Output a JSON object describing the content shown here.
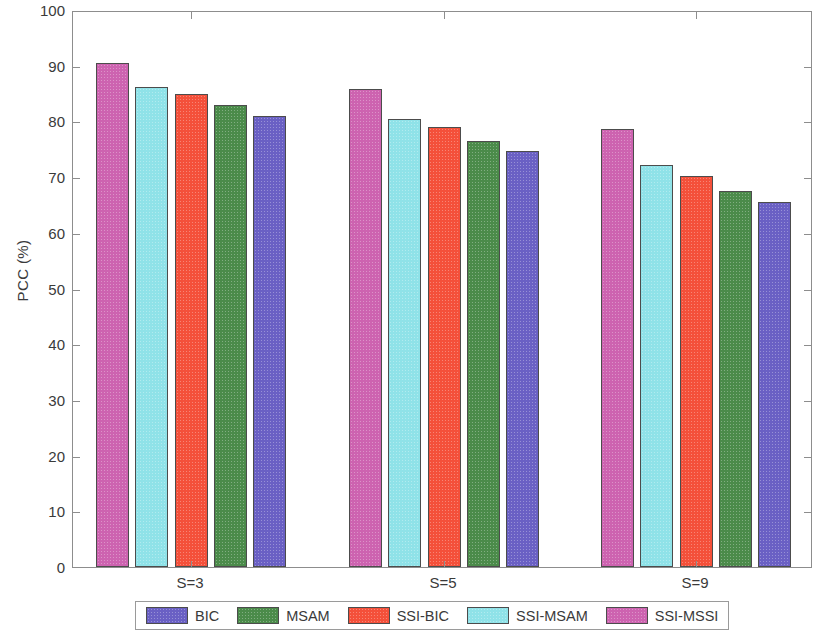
{
  "chart_data": {
    "type": "bar",
    "title": "",
    "subtitle": "",
    "xlabel": "",
    "ylabel": "PCC (%)",
    "categories": [
      "S=3",
      "S=5",
      "S=9"
    ],
    "ylim": [
      0,
      100
    ],
    "yticks": [
      0,
      10,
      20,
      30,
      40,
      50,
      60,
      70,
      80,
      90,
      100
    ],
    "ytick_labels": [
      "0",
      "10",
      "20",
      "30",
      "40",
      "50",
      "60",
      "70",
      "80",
      "90",
      "100"
    ],
    "grid": false,
    "legend_position": "bottom",
    "bar_draw_order": [
      "SSI-MSSI",
      "SSI-MSAM",
      "SSI-BIC",
      "MSAM",
      "BIC"
    ],
    "series": [
      {
        "name": "BIC",
        "color": "#6a60c4",
        "values": [
          81.0,
          74.7,
          65.5
        ]
      },
      {
        "name": "MSAM",
        "color": "#4b8b4a",
        "values": [
          83.0,
          76.4,
          67.5
        ]
      },
      {
        "name": "SSI-BIC",
        "color": "#f4503a",
        "values": [
          85.0,
          79.0,
          70.2
        ]
      },
      {
        "name": "SSI-MSAM",
        "color": "#8fe2e8",
        "values": [
          86.1,
          80.4,
          72.2
        ]
      },
      {
        "name": "SSI-MSSI",
        "color": "#cd63b0",
        "values": [
          90.5,
          85.9,
          78.6
        ]
      }
    ]
  },
  "legend": {
    "items": [
      {
        "label": "BIC",
        "color": "#6a60c4"
      },
      {
        "label": "MSAM",
        "color": "#4b8b4a"
      },
      {
        "label": "SSI-BIC",
        "color": "#f4503a"
      },
      {
        "label": "SSI-MSAM",
        "color": "#8fe2e8"
      },
      {
        "label": "SSI-MSSI",
        "color": "#cd63b0"
      }
    ]
  },
  "axes": {
    "y_label": "PCC (%)",
    "y_min": 0,
    "y_max": 100,
    "x_group_labels": [
      "S=3",
      "S=5",
      "S=9"
    ]
  }
}
